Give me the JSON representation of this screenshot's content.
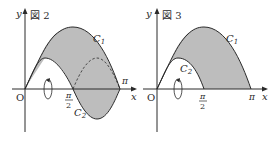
{
  "figures": [
    {
      "id": "fig2",
      "title": "図 2",
      "axis_x_label": "x",
      "axis_y_label": "y",
      "origin_label": "O",
      "tick_pi": "π",
      "tick_half_pi_num": "π",
      "tick_half_pi_den": "2",
      "curve1_label": "C",
      "curve1_sub": "1",
      "curve2_label": "C",
      "curve2_sub": "2"
    },
    {
      "id": "fig3",
      "title": "図 3",
      "axis_x_label": "x",
      "axis_y_label": "y",
      "origin_label": "O",
      "tick_pi": "π",
      "tick_half_pi_num": "π",
      "tick_half_pi_den": "2",
      "curve1_label": "C",
      "curve1_sub": "1",
      "curve2_label": "C",
      "curve2_sub": "2"
    }
  ],
  "colors": {
    "shade": "#bdbdbd",
    "line": "#2a2a2a",
    "background": "#ffffff"
  }
}
